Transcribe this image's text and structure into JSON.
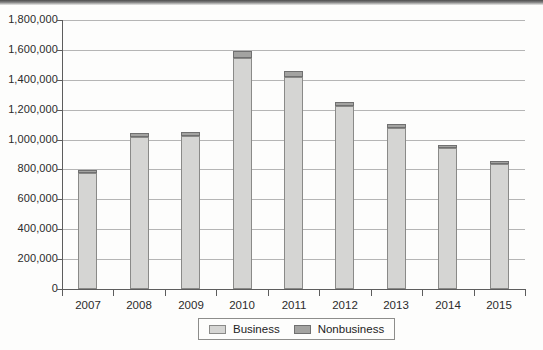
{
  "chart_data": {
    "type": "bar",
    "subtype": "stacked-column",
    "title": "",
    "xlabel": "",
    "ylabel": "",
    "categories": [
      "2007",
      "2008",
      "2009",
      "2010",
      "2011",
      "2012",
      "2013",
      "2014",
      "2015"
    ],
    "series": [
      {
        "name": "Business",
        "color": "#d5d5d3",
        "values": [
          775000,
          1015000,
          1025000,
          1545000,
          1420000,
          1225000,
          1080000,
          945000,
          835000
        ]
      },
      {
        "name": "Nonbusiness",
        "color": "#a3a3a1",
        "values": [
          20000,
          25000,
          30000,
          45000,
          40000,
          30000,
          25000,
          20000,
          20000
        ]
      }
    ],
    "totals": [
      795000,
      1040000,
      1055000,
      1590000,
      1460000,
      1255000,
      1105000,
      965000,
      855000
    ],
    "ylim": [
      0,
      1800000
    ],
    "ytick_step": 200000,
    "ytick_labels": [
      "1,800,000",
      "1,600,000",
      "1,400,000",
      "1,200,000",
      "1,000,000",
      "800,000",
      "600,000",
      "400,000",
      "200,000",
      "0"
    ],
    "ytick_values": [
      1800000,
      1600000,
      1400000,
      1200000,
      1000000,
      800000,
      600000,
      400000,
      200000,
      0
    ],
    "grid": true,
    "grid_axis": "y",
    "legend_position": "bottom",
    "legend": [
      "Business",
      "Nonbusiness"
    ]
  },
  "colors": {
    "business": "#d5d5d3",
    "nonbusiness": "#a3a3a1",
    "gridline": "#b5b5b5",
    "axis": "#5d5d5d",
    "text": "#2b2b2b",
    "background": "#fdfdfc"
  }
}
